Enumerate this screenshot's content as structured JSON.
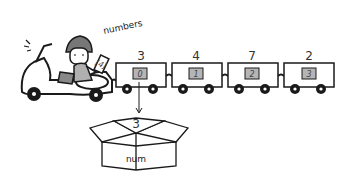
{
  "diagram": {
    "array_label": "numbers",
    "tag_label": "[4]",
    "cars": [
      {
        "index": "0",
        "value": "3"
      },
      {
        "index": "1",
        "value": "4"
      },
      {
        "index": "2",
        "value": "7"
      },
      {
        "index": "3",
        "value": "2"
      }
    ],
    "box": {
      "label": "num",
      "value": "3"
    }
  },
  "colors": {
    "stroke": "#1a1a1a",
    "index_box_fill": "#b5b5b5",
    "helmet": "#777777",
    "shirt": "#b0b0b0"
  }
}
